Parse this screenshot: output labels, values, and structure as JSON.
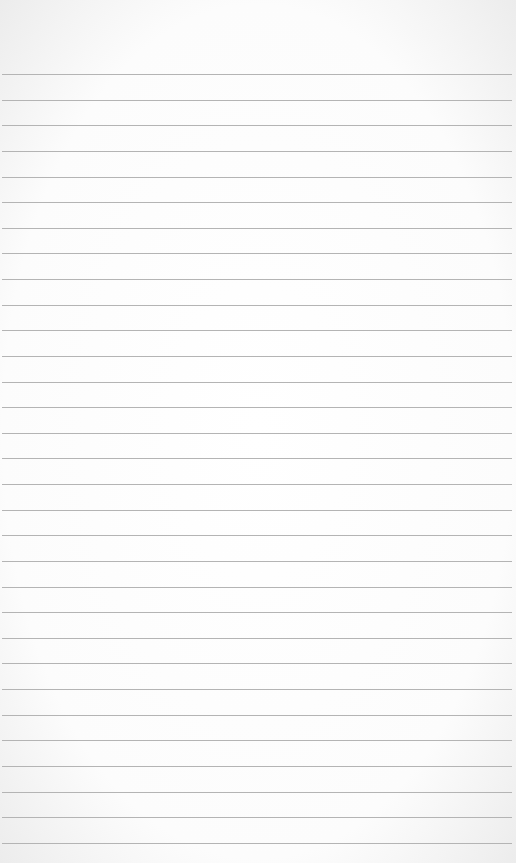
{
  "paper": {
    "type": "ruled-sheet",
    "line_count": 31,
    "first_line_y": 74,
    "line_spacing": 25.63,
    "line_color": "#b4b4b4",
    "background_color": "#fcfcfc"
  }
}
